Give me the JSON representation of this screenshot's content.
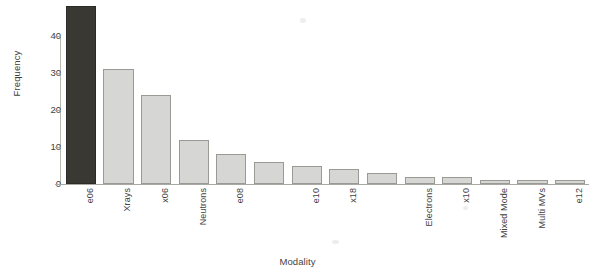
{
  "chart_data": {
    "type": "bar",
    "title": "",
    "xlabel": "Modality",
    "ylabel": "Frequency",
    "ylim": [
      0,
      48
    ],
    "ytick_labels": [
      "0",
      "10",
      "20",
      "30",
      "40"
    ],
    "ytick_values": [
      0,
      10,
      20,
      30,
      40
    ],
    "grid": false,
    "legend": null,
    "categories": [
      "e06",
      "Xrays",
      "x06",
      "Neutrons",
      "e08",
      "",
      "e10",
      "x18",
      "",
      "Electrons",
      "x10",
      "Mixed Mode",
      "Multi MVs",
      "e12"
    ],
    "values": [
      48,
      31,
      24,
      12,
      8,
      6,
      5,
      4,
      3,
      2,
      2,
      1,
      1,
      1
    ],
    "bar_colors": [
      "#3a3833",
      "#d6d6d4",
      "#d6d6d4",
      "#d6d6d4",
      "#d6d6d4",
      "#d6d6d4",
      "#d6d6d4",
      "#d6d6d4",
      "#d6d6d4",
      "#d6d6d4",
      "#d6d6d4",
      "#d6d6d4",
      "#d6d6d4",
      "#d6d6d4"
    ],
    "highlight_index": 0,
    "highlight_color": "#3a3833",
    "bar_color": "#d6d6d4",
    "bar_border_color": "#9a9a95",
    "axis_color": "#a9a9a4",
    "text_color": "#3f3f3f"
  },
  "axes": {
    "y_title": "Frequency",
    "x_title": "Modality"
  }
}
